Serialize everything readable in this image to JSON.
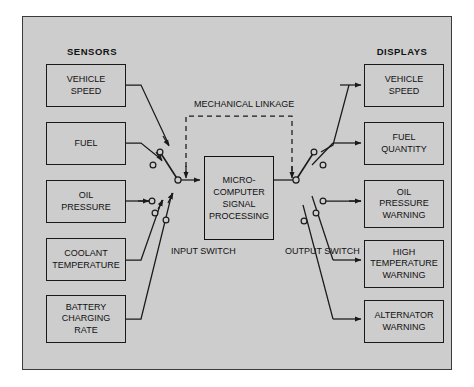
{
  "diagram": {
    "title_sensors": "SENSORS",
    "title_displays": "DISPLAYS",
    "mechanical_linkage_label": "MECHANICAL\nLINKAGE",
    "mechanical_linkage_line1": "MECHANICAL",
    "mechanical_linkage_line2": "LINKAGE",
    "input_switch_line1": "INPUT",
    "input_switch_line2": "SWITCH",
    "output_switch_line1": "OUTPUT",
    "output_switch_line2": "SWITCH",
    "colors": {
      "panel_background": "#cdcdcd",
      "panel_border": "#3a3a3a",
      "box_border": "#1a1a1a",
      "wire": "#1a1a1a",
      "text": "#111111",
      "page_background": "#ffffff"
    },
    "processor": {
      "name": "microcomputer-signal-processing",
      "line1": "MICRO-",
      "line2": "COMPUTER",
      "line3": "SIGNAL",
      "line4": "PROCESSING"
    },
    "sensors": [
      {
        "id": "vehicle-speed",
        "line1": "VEHICLE",
        "line2": "SPEED",
        "line3": ""
      },
      {
        "id": "fuel",
        "line1": "FUEL",
        "line2": "",
        "line3": ""
      },
      {
        "id": "oil-pressure",
        "line1": "OIL",
        "line2": "PRESSURE",
        "line3": ""
      },
      {
        "id": "coolant-temperature",
        "line1": "COOLANT",
        "line2": "TEMPERATURE",
        "line3": ""
      },
      {
        "id": "battery-charging-rate",
        "line1": "BATTERY",
        "line2": "CHARGING",
        "line3": "RATE"
      }
    ],
    "displays": [
      {
        "id": "vehicle-speed",
        "line1": "VEHICLE",
        "line2": "SPEED",
        "line3": ""
      },
      {
        "id": "fuel-quantity",
        "line1": "FUEL",
        "line2": "QUANTITY",
        "line3": ""
      },
      {
        "id": "oil-pressure-warning",
        "line1": "OIL",
        "line2": "PRESSURE",
        "line3": "WARNING"
      },
      {
        "id": "high-temperature-warning",
        "line1": "HIGH",
        "line2": "TEMPERATURE",
        "line3": "WARNING"
      },
      {
        "id": "alternator-warning",
        "line1": "ALTERNATOR",
        "line2": "WARNING",
        "line3": ""
      }
    ]
  }
}
